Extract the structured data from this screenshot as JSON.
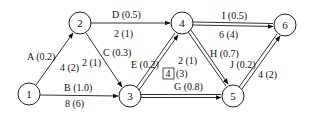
{
  "diagram": {
    "type": "activity-network",
    "nodes": [
      {
        "id": "1",
        "label": "1",
        "x": 29,
        "y": 94
      },
      {
        "id": "2",
        "label": "2",
        "x": 80,
        "y": 23
      },
      {
        "id": "3",
        "label": "3",
        "x": 130,
        "y": 96
      },
      {
        "id": "4",
        "label": "4",
        "x": 182,
        "y": 23
      },
      {
        "id": "5",
        "label": "5",
        "x": 233,
        "y": 96
      },
      {
        "id": "6",
        "label": "6",
        "x": 285,
        "y": 25
      }
    ],
    "edges": [
      {
        "id": "A",
        "from": "1",
        "to": "2",
        "name": "A (0.2)",
        "value": "4 (2)",
        "critical": false
      },
      {
        "id": "B",
        "from": "1",
        "to": "3",
        "name": "B (1.0)",
        "value": "8 (6)",
        "critical": false
      },
      {
        "id": "C",
        "from": "2",
        "to": "3",
        "name": "C (0.3)",
        "value": "2 (1)",
        "critical": false
      },
      {
        "id": "D",
        "from": "2",
        "to": "4",
        "name": "D (0.5)",
        "value": "2 (1)",
        "critical": false
      },
      {
        "id": "E",
        "from": "3",
        "to": "4",
        "name": "E (0.2)",
        "value": "4",
        "value_suffix": "(3)",
        "boxed": true,
        "critical": true
      },
      {
        "id": "G",
        "from": "3",
        "to": "5",
        "name": "G (0.8)",
        "value": "",
        "critical": true
      },
      {
        "id": "H",
        "from": "4",
        "to": "5",
        "name": "H (0.7)",
        "value": "2 (1)",
        "critical": true
      },
      {
        "id": "I",
        "from": "4",
        "to": "6",
        "name": "I (0.5)",
        "value": "6 (4)",
        "critical": true
      },
      {
        "id": "J",
        "from": "5",
        "to": "6",
        "name": "J (0.2)",
        "value": "4 (2)",
        "critical": true
      }
    ]
  },
  "labels": {
    "node1": "1",
    "node2": "2",
    "node3": "3",
    "node4": "4",
    "node5": "5",
    "node6": "6",
    "A_name": "A (0.2)",
    "A_value": "4 (2)",
    "B_name": "B (1.0)",
    "B_value": "8 (6)",
    "C_name": "C (0.3)",
    "C_value": "2 (1)",
    "D_name": "D (0.5)",
    "D_value": "2 (1)",
    "E_name": "E (0.2)",
    "E_box": "4",
    "E_suffix": "(3)",
    "G_name": "G (0.8)",
    "H_name": "H (0.7)",
    "H_value": "2 (1)",
    "I_name": "I (0.5)",
    "I_value": "6 (4)",
    "J_name": "J (0.2)",
    "J_value": "4 (2)"
  }
}
